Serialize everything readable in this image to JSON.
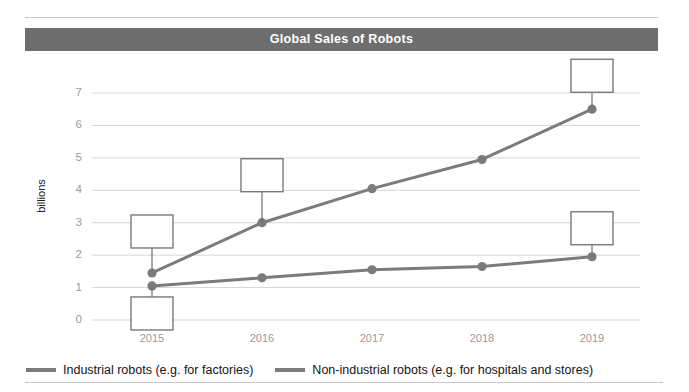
{
  "chart_data": {
    "type": "line",
    "title": "Global Sales of Robots",
    "xlabel": "",
    "ylabel": "billions",
    "categories": [
      "2015",
      "2016",
      "2017",
      "2018",
      "2019"
    ],
    "x": [
      2015,
      2016,
      2017,
      2018,
      2019
    ],
    "ylim": [
      0,
      7.5
    ],
    "y_ticks": [
      "0",
      "1",
      "2",
      "3",
      "4",
      "5",
      "6",
      "7"
    ],
    "y_tick_values": [
      0,
      1,
      2,
      3,
      4,
      5,
      6,
      7
    ],
    "grid": true,
    "legend_position": "bottom",
    "series": [
      {
        "name": "Industrial robots (e.g. for factories)",
        "color": "#7b7b7b",
        "values": [
          1.45,
          3.0,
          4.05,
          4.95,
          6.5
        ]
      },
      {
        "name": "Non-industrial robots (e.g. for hospitals and stores)",
        "color": "#7b7b7b",
        "values": [
          1.05,
          1.3,
          1.55,
          1.65,
          1.95
        ]
      }
    ],
    "annotations": [
      {
        "id": "box-2015-industrial",
        "series": "Industrial robots (e.g. for factories)",
        "category": "2015",
        "text": ""
      },
      {
        "id": "box-2016-industrial",
        "series": "Industrial robots (e.g. for factories)",
        "category": "2016",
        "text": ""
      },
      {
        "id": "box-2019-industrial",
        "series": "Industrial robots (e.g. for factories)",
        "category": "2019",
        "text": ""
      },
      {
        "id": "box-2015-nonindustrial",
        "series": "Non-industrial robots (e.g. for hospitals and stores)",
        "category": "2015",
        "text": ""
      },
      {
        "id": "box-2019-nonindustrial",
        "series": "Non-industrial robots (e.g. for hospitals and stores)",
        "category": "2019",
        "text": ""
      }
    ]
  },
  "colors": {
    "banner_bg": "#6e6e6e",
    "banner_text": "#ffffff",
    "grid": "#d6d6d6",
    "series": "#7b7b7b",
    "tick_text": "#9a9a9a",
    "rule": "#c9c9c9",
    "callout_border": "#6f6f6f"
  },
  "title": {
    "text": "Global Sales of Robots"
  },
  "axes": {
    "y_label": "billions",
    "y_ticks": [
      "7",
      "6",
      "5",
      "4",
      "3",
      "2",
      "1",
      "0"
    ],
    "x_ticks": [
      "2015",
      "2016",
      "2017",
      "2018",
      "2019"
    ]
  },
  "legend": {
    "items": [
      {
        "label": "Industrial robots (e.g. for factories)"
      },
      {
        "label": "Non-industrial robots (e.g. for hospitals and stores)"
      }
    ]
  }
}
